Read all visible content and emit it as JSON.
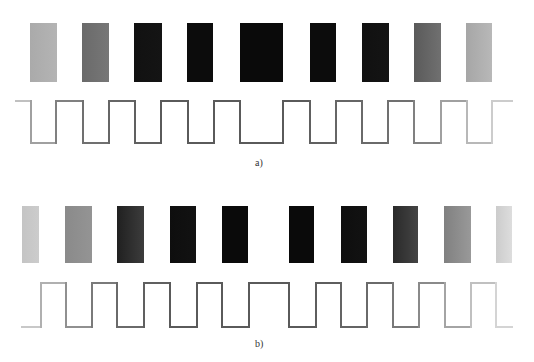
{
  "panels": [
    {
      "id": "a",
      "label": "a)",
      "label_pos": {
        "x": 255,
        "y": 157
      },
      "bars": {
        "top": 23,
        "height": 59,
        "items": [
          {
            "x": 30,
            "w": 27,
            "color": "#aaaaaa",
            "grad": "#b4b4b4"
          },
          {
            "x": 82,
            "w": 27,
            "color": "#6a6a6a",
            "grad": "#777777"
          },
          {
            "x": 134,
            "w": 28,
            "color": "#111111",
            "grad": "#141414"
          },
          {
            "x": 187,
            "w": 26,
            "color": "#0c0c0c",
            "grad": "#0c0c0c"
          },
          {
            "x": 240,
            "w": 43,
            "color": "#0a0a0a",
            "grad": "#0a0a0a"
          },
          {
            "x": 310,
            "w": 26,
            "color": "#0c0c0c",
            "grad": "#0c0c0c"
          },
          {
            "x": 362,
            "w": 27,
            "color": "#111111",
            "grad": "#141414"
          },
          {
            "x": 414,
            "w": 27,
            "color": "#5a5a5a",
            "grad": "#707070"
          },
          {
            "x": 466,
            "w": 26,
            "color": "#a6a6a6",
            "grad": "#b8b8b8"
          }
        ]
      },
      "wave": {
        "high": 101,
        "low": 143,
        "start_x": 16,
        "end_x": 512,
        "start_level": "high",
        "transitions": [
          31,
          56,
          83,
          109,
          135,
          161,
          188,
          214,
          240,
          283,
          310,
          336,
          362,
          388,
          414,
          441,
          467,
          492
        ],
        "colors": [
          "#c0c0c0",
          "#a0a0a0",
          "#808080",
          "#707070",
          "#666666",
          "#606060",
          "#5a5a5a",
          "#5a5a5a",
          "#5a5a5a",
          "#5a5a5a",
          "#5a5a5a",
          "#606060",
          "#666666",
          "#6a6a6a",
          "#707070",
          "#808080",
          "#a0a0a0",
          "#b8b8b8",
          "#cccccc"
        ]
      }
    },
    {
      "id": "b",
      "label": "b)",
      "label_pos": {
        "x": 255,
        "y": 338
      },
      "bars": {
        "top": 206,
        "height": 57,
        "items": [
          {
            "x": 22,
            "w": 17,
            "color": "#c4c4c4",
            "grad": "#cccccc"
          },
          {
            "x": 65,
            "w": 27,
            "color": "#8a8a8a",
            "grad": "#949494"
          },
          {
            "x": 117,
            "w": 27,
            "color": "#202020",
            "grad": "#3c3c3c"
          },
          {
            "x": 170,
            "w": 26,
            "color": "#0e0e0e",
            "grad": "#121212"
          },
          {
            "x": 222,
            "w": 26,
            "color": "#0a0a0a",
            "grad": "#0a0a0a"
          },
          {
            "x": 289,
            "w": 25,
            "color": "#0a0a0a",
            "grad": "#0a0a0a"
          },
          {
            "x": 341,
            "w": 26,
            "color": "#0e0e0e",
            "grad": "#121212"
          },
          {
            "x": 393,
            "w": 25,
            "color": "#2a2a2a",
            "grad": "#444444"
          },
          {
            "x": 444,
            "w": 27,
            "color": "#808080",
            "grad": "#999999"
          },
          {
            "x": 496,
            "w": 16,
            "color": "#cccccc",
            "grad": "#dddddd"
          }
        ]
      },
      "wave": {
        "high": 283,
        "low": 327,
        "start_x": 22,
        "end_x": 512,
        "start_level": "low",
        "transitions": [
          41,
          66,
          92,
          117,
          144,
          170,
          197,
          222,
          249,
          289,
          316,
          341,
          367,
          393,
          419,
          445,
          471,
          496
        ],
        "colors": [
          "#c8c8c8",
          "#b0b0b0",
          "#909090",
          "#7a7a7a",
          "#6a6a6a",
          "#606060",
          "#5a5a5a",
          "#5a5a5a",
          "#5a5a5a",
          "#5a5a5a",
          "#5a5a5a",
          "#5e5e5e",
          "#646464",
          "#6a6a6a",
          "#787878",
          "#8a8a8a",
          "#a4a4a4",
          "#c0c0c0",
          "#d4d4d4"
        ]
      }
    }
  ]
}
